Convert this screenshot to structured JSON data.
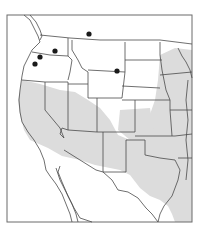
{
  "map": {
    "type": "range-map",
    "region": "Western and central United States with northern Mexico",
    "colors": {
      "background": "#ffffff",
      "frame": "#6b6b6b",
      "border": "#4a4a4a",
      "range_fill": "#d9d9d9",
      "dot": "#1a1a1a"
    },
    "frame": {
      "x": 7,
      "y": 15,
      "width": 185,
      "height": 207
    },
    "occurrence_points": [
      {
        "id": "pt-montana-north",
        "x": 89,
        "y": 34
      },
      {
        "id": "pt-washington-east",
        "x": 55,
        "y": 51
      },
      {
        "id": "pt-washington-west",
        "x": 40,
        "y": 57
      },
      {
        "id": "pt-oregon-nw",
        "x": 35,
        "y": 64
      },
      {
        "id": "pt-wyoming",
        "x": 117,
        "y": 71
      }
    ]
  }
}
